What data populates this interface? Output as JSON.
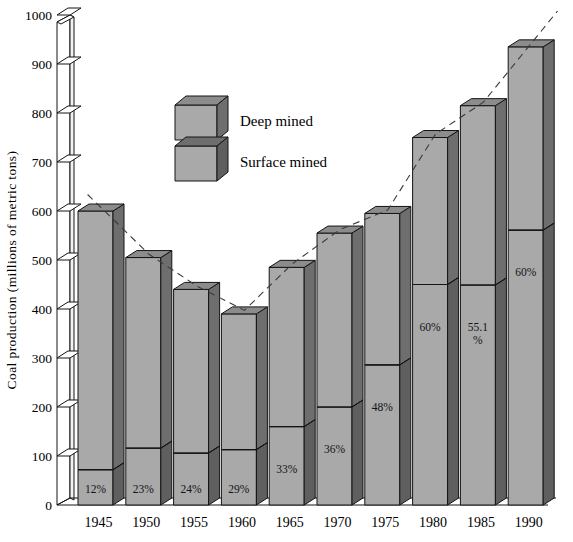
{
  "chart_data": {
    "type": "bar",
    "title": "",
    "subtitle": "",
    "xlabel": "",
    "ylabel": "Coal production (millions of metric tons)",
    "categories": [
      "1945",
      "1950",
      "1955",
      "1960",
      "1965",
      "1970",
      "1975",
      "1980",
      "1985",
      "1990"
    ],
    "ylim": [
      0,
      1000
    ],
    "ytick_values": [
      0,
      100,
      200,
      300,
      400,
      500,
      600,
      700,
      800,
      900,
      1000
    ],
    "ytick_labels": [
      "0",
      "100",
      "200",
      "300",
      "400",
      "500",
      "600",
      "700",
      "800",
      "900",
      "1000"
    ],
    "grid": false,
    "stacked": true,
    "legend_position": "upper-left-inside",
    "series": [
      {
        "name": "Deep mined",
        "color": "#a9a9a9",
        "values": [
          528,
          389,
          334,
          277,
          325,
          355,
          309,
          300,
          366,
          374
        ]
      },
      {
        "name": "Surface mined",
        "color": "#a9a9a9",
        "values": [
          72,
          116,
          106,
          113,
          160,
          200,
          286,
          450,
          449,
          561
        ]
      }
    ],
    "totals": [
      600,
      505,
      440,
      390,
      485,
      555,
      595,
      750,
      815,
      935
    ],
    "surface_share_labels": [
      "12%",
      "23%",
      "24%",
      "29%",
      "33%",
      "36%",
      "48%",
      "60%",
      "55.1\n%",
      "60%"
    ],
    "surface_share_values": [
      12,
      23,
      24,
      29,
      33,
      36,
      48,
      60,
      55.1,
      60
    ],
    "annotations": {
      "trend_line": {
        "style": "dashed",
        "color": "#3a3a3a",
        "description": "dashed line connecting the top of each bar"
      }
    }
  },
  "legend": {
    "items": [
      {
        "label": "Deep mined",
        "swatch": "deep-mined-cube"
      },
      {
        "label": "Surface mined",
        "swatch": "surface-mined-cube"
      }
    ]
  },
  "colors": {
    "bar_front": "#a9a9a9",
    "bar_side": "#6e6e6e",
    "bar_top": "#8c8c8c",
    "outline": "#141414",
    "axis": "#141414",
    "background": "#ffffff"
  }
}
